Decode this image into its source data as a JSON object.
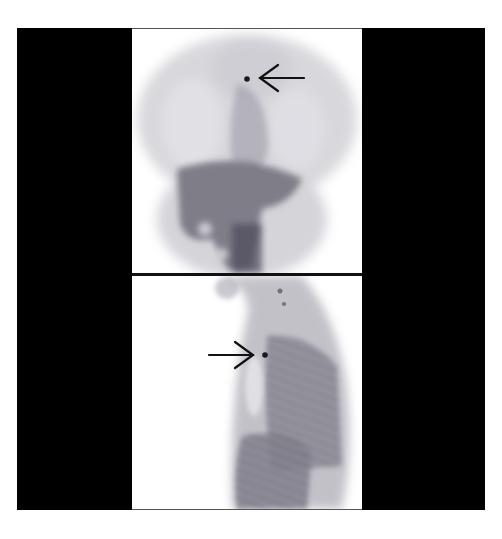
{
  "figure": {
    "panels": [
      {
        "id": "anterior",
        "position": "top",
        "arrow_direction": "left",
        "arrow_target": "focal uptake in upper chest / neck region"
      },
      {
        "id": "lateral",
        "position": "bottom",
        "arrow_direction": "right",
        "arrow_target": "focal uptake anterior to spine"
      }
    ],
    "colors": {
      "background": "#ffffff",
      "bars": "#000000",
      "uptake": "#6f6a78",
      "hot_spot": "#1a1a1a",
      "arrow": "#111111"
    }
  }
}
